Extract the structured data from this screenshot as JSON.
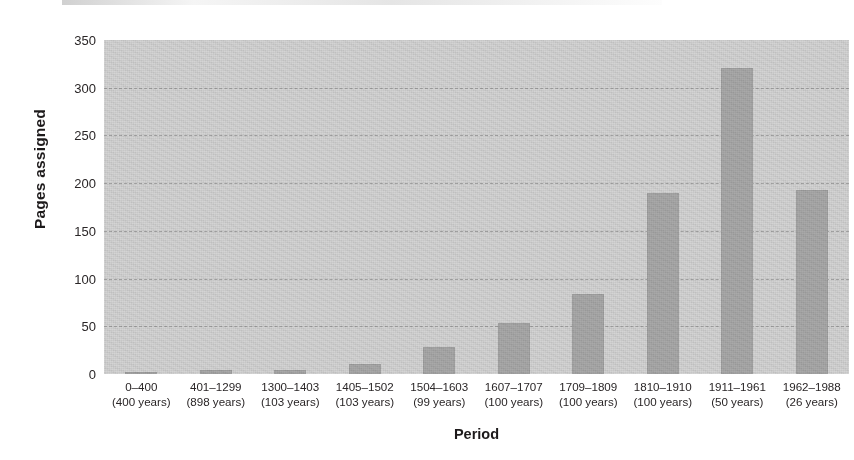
{
  "chart_data": {
    "type": "bar",
    "title": "",
    "xlabel": "Period",
    "ylabel": "Pages assigned",
    "ylim": [
      0,
      350
    ],
    "ytick_step": 50,
    "yticks": [
      0,
      50,
      100,
      150,
      200,
      250,
      300,
      350
    ],
    "grid": true,
    "legend": null,
    "categories": [
      "0–400\n(400 years)",
      "401–1299\n(898 years)",
      "1300–1403\n(103 years)",
      "1405–1502\n(103 years)",
      "1504–1603\n(99 years)",
      "1607–1707\n(100 years)",
      "1709–1809\n(100 years)",
      "1810–1910\n(100 years)",
      "1911–1961\n(50 years)",
      "1962–1988\n(26 years)"
    ],
    "values": [
      2,
      4,
      4,
      11,
      28,
      53,
      84,
      190,
      321,
      193
    ],
    "bar_color": "#a9a9a9",
    "plot_background": "#d4d4d4"
  },
  "axes": {
    "y_title": "Pages assigned",
    "x_title": "Period",
    "y_ticks": [
      {
        "label": "350",
        "value": 350
      },
      {
        "label": "300",
        "value": 300
      },
      {
        "label": "250",
        "value": 250
      },
      {
        "label": "200",
        "value": 200
      },
      {
        "label": "150",
        "value": 150
      },
      {
        "label": "100",
        "value": 100
      },
      {
        "label": "50",
        "value": 50
      },
      {
        "label": "0",
        "value": 0
      }
    ],
    "x_ticks": [
      {
        "range": "0–400",
        "duration": "(400 years)",
        "value": 2
      },
      {
        "range": "401–1299",
        "duration": "(898 years)",
        "value": 4
      },
      {
        "range": "1300–1403",
        "duration": "(103 years)",
        "value": 4
      },
      {
        "range": "1405–1502",
        "duration": "(103 years)",
        "value": 11
      },
      {
        "range": "1504–1603",
        "duration": "(99 years)",
        "value": 28
      },
      {
        "range": "1607–1707",
        "duration": "(100 years)",
        "value": 53
      },
      {
        "range": "1709–1809",
        "duration": "(100 years)",
        "value": 84
      },
      {
        "range": "1810–1910",
        "duration": "(100 years)",
        "value": 190
      },
      {
        "range": "1911–1961",
        "duration": "(50 years)",
        "value": 321
      },
      {
        "range": "1962–1988",
        "duration": "(26 years)",
        "value": 193
      }
    ]
  },
  "colors": {
    "bar": "#a9a9a9",
    "plot_background": "#d4d4d4",
    "page_background": "#ffffff",
    "gridline": "#787878",
    "text": "#231f20"
  }
}
